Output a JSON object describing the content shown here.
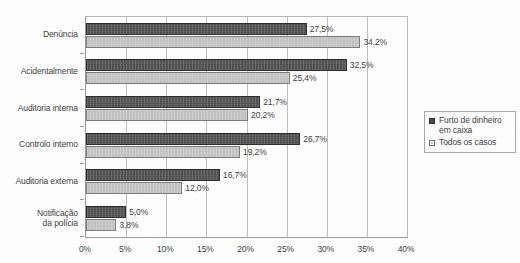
{
  "chart_data": {
    "type": "bar",
    "orientation": "horizontal",
    "title": "",
    "subtitle": "",
    "xlabel": "",
    "ylabel": "",
    "xlim": [
      0,
      40
    ],
    "xtick_step": 5,
    "xticks": [
      "0%",
      "5%",
      "10%",
      "15%",
      "20%",
      "25%",
      "30%",
      "35%",
      "40%"
    ],
    "grid": true,
    "grid_axis": "x",
    "legend_position": "right",
    "value_suffix": "%",
    "decimal_separator": ",",
    "categories": [
      "Denúncia",
      "Acidentalmente",
      "Auditoria interna",
      "Controlo interno",
      "Auditoria externa",
      "Notificação\nda polícia"
    ],
    "series": [
      {
        "name": "Furto de dinheiro\nem caixa",
        "color": "#4c4c4c",
        "values": [
          27.5,
          32.5,
          21.7,
          26.7,
          16.7,
          5.0
        ],
        "labels": [
          "27,5%",
          "32,5%",
          "21,7%",
          "26,7%",
          "16,7%",
          "5,0%"
        ]
      },
      {
        "name": "Todos os casos",
        "color": "#c2c2c2",
        "values": [
          34.2,
          25.4,
          20.2,
          19.2,
          12.0,
          3.8
        ],
        "labels": [
          "34,2%",
          "25,4%",
          "20,2%",
          "19,2%",
          "12,0%",
          "3,8%"
        ]
      }
    ]
  },
  "legend": {
    "items": [
      {
        "label": "Furto de dinheiro\nem caixa",
        "swatch": "dark"
      },
      {
        "label": "Todos os casos",
        "swatch": "light"
      }
    ]
  }
}
